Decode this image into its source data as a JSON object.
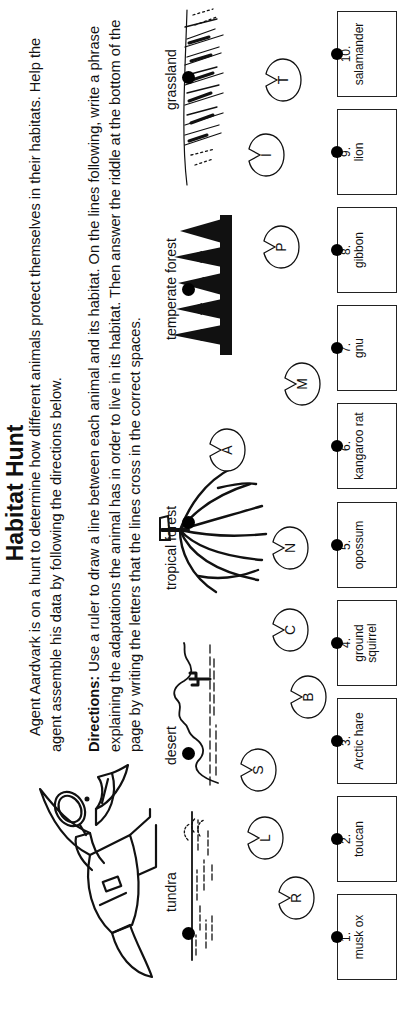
{
  "title": "Habitat Hunt",
  "intro": "Agent Aardvark is on a hunt to determine how different animals protect themselves in their habitats. Help the agent assemble his data by following the directions below.",
  "directions": {
    "label": "Directions:",
    "text": " Use a ruler to draw a line between each animal and its habitat. On the lines following, write a phrase explaining the adaptations the animal has in order to live in its habitat. Then answer the riddle at the bottom of the page by writing the letters that the lines cross in the correct spaces."
  },
  "habitats": [
    {
      "label": "tundra"
    },
    {
      "label": "desert"
    },
    {
      "label": "tropical forest"
    },
    {
      "label": "temperate forest"
    },
    {
      "label": "grassland"
    }
  ],
  "letters": [
    "R",
    "L",
    "S",
    "B",
    "C",
    "N",
    "A",
    "M",
    "P",
    "I",
    "T"
  ],
  "animals": [
    {
      "num": "1.",
      "name": "musk ox"
    },
    {
      "num": "2.",
      "name": "toucan"
    },
    {
      "num": "3.",
      "name": "Arctic hare"
    },
    {
      "num": "4.",
      "name": "ground squirrel"
    },
    {
      "num": "5.",
      "name": "opossum"
    },
    {
      "num": "6.",
      "name": "kangaroo rat"
    },
    {
      "num": "7.",
      "name": "gnu"
    },
    {
      "num": "8.",
      "name": "gibbon"
    },
    {
      "num": "9.",
      "name": "lion"
    },
    {
      "num": "10.",
      "name": "salamander"
    }
  ],
  "icons": {
    "mascot": "aardvark-detective-illustration",
    "pad": "lily-pad-icon",
    "dot": "connection-dot"
  },
  "colors": {
    "ink": "#111111",
    "paper": "#ffffff"
  }
}
